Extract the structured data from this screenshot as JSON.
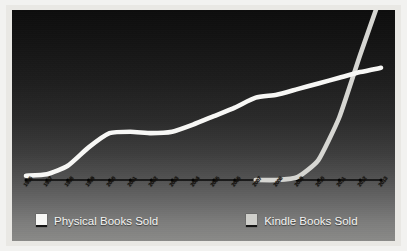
{
  "chart_data": {
    "type": "line",
    "title": "",
    "xlabel": "",
    "ylabel": "",
    "grid": false,
    "legend_position": "bottom",
    "x": [
      "1996",
      "1997",
      "1998",
      "1999",
      "2000",
      "2001",
      "2002",
      "2003",
      "2004",
      "2005",
      "2006",
      "2007",
      "2008",
      "2009",
      "2010",
      "2011",
      "2012",
      "2013"
    ],
    "xlim": [
      "1996",
      "2013"
    ],
    "ylim": [
      0,
      100
    ],
    "series": [
      {
        "name": "Physical Books Sold",
        "color": "#f7f7f5",
        "values": [
          3,
          4,
          10,
          23,
          33,
          34,
          33,
          34,
          39,
          45,
          51,
          58,
          60,
          64,
          68,
          72,
          76,
          79
        ]
      },
      {
        "name": "Kindle Books Sold",
        "color": "#d6d6d2",
        "values": [
          0,
          0,
          0,
          0,
          0,
          0,
          0,
          0,
          0,
          0,
          0,
          0,
          0,
          2,
          14,
          44,
          88,
          130
        ]
      }
    ]
  },
  "axis": {
    "tick_labels": [
      "1996",
      "1997",
      "1998",
      "1999",
      "2000",
      "2001",
      "2002",
      "2003",
      "2004",
      "2005",
      "2006",
      "2007",
      "2008",
      "2009",
      "2010",
      "2011",
      "2012",
      "2013"
    ]
  },
  "legend": {
    "items": [
      {
        "label": "Physical Books Sold",
        "swatch_color": "#f7f7f5"
      },
      {
        "label": "Kindle Books Sold",
        "swatch_color": "#cfcfcb"
      }
    ]
  },
  "colors": {
    "frame": "#e9e8e4",
    "plot_top": "#0d0d0d",
    "plot_bottom": "#8a8a88",
    "physical_line": "#f7f7f5",
    "kindle_line": "#d6d6d2",
    "axis_line": "#0a0a0a",
    "tick_label": "#15110c",
    "legend_text": "#f4f4f2"
  }
}
